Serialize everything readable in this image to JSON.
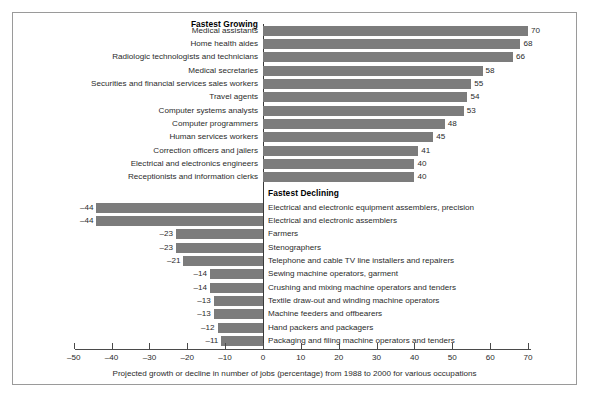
{
  "figure": {
    "caption": "Projected growth or decline in number of jobs (percentage) from 1988 to 2000 for various occupations",
    "bar_color": "#7c7c7c",
    "axis_color": "#4a4a4a",
    "frame_color": "#9a9a9a",
    "background": "#ffffff"
  },
  "sections": {
    "growing_heading": "Fastest Growing",
    "declining_heading": "Fastest Declining"
  },
  "chart_data": {
    "type": "bar",
    "orientation": "horizontal",
    "title": "",
    "subtitle": "",
    "xlabel": "Projected growth or decline in number of jobs (percentage) from 1988 to 2000 for various occupations",
    "ylabel": "",
    "xlim": [
      -55,
      76
    ],
    "xticks": [
      -50,
      -40,
      -30,
      -20,
      -10,
      0,
      10,
      20,
      30,
      40,
      50,
      60,
      70
    ],
    "xtick_labels": [
      "-50",
      "-40",
      "-30",
      "-20",
      "-10",
      "0",
      "10",
      "20",
      "30",
      "40",
      "50",
      "60",
      "70"
    ],
    "grid": false,
    "legend": "none",
    "groups": [
      {
        "name": "Fastest Growing",
        "label_side": "left",
        "categories": [
          "Medical assistants",
          "Home health aides",
          "Radiologic technologists and technicians",
          "Medical secretaries",
          "Securities and financial services sales workers",
          "Travel agents",
          "Computer systems analysts",
          "Computer programmers",
          "Human services workers",
          "Correction officers and jailers",
          "Electrical and electronics engineers",
          "Receptionists and information clerks"
        ],
        "values": [
          70,
          68,
          66,
          58,
          55,
          54,
          53,
          48,
          45,
          41,
          40,
          40
        ],
        "data_labels": [
          "70",
          "68",
          "66",
          "58",
          "55",
          "54",
          "53",
          "48",
          "45",
          "41",
          "40",
          "40"
        ]
      },
      {
        "name": "Fastest Declining",
        "label_side": "right",
        "categories": [
          "Electrical and electronic equipment assemblers, precision",
          "Electrical and electronic assemblers",
          "Farmers",
          "Stenographers",
          "Telephone and cable TV line installers and repairers",
          "Sewing machine operators, garment",
          "Crushing and mixing machine operators and tenders",
          "Textile draw-out and winding machine operators",
          "Machine feeders and offbearers",
          "Hand packers and packagers",
          "Packaging and filing machine operators and tenders"
        ],
        "values": [
          -44,
          -44,
          -23,
          -23,
          -21,
          -14,
          -14,
          -13,
          -13,
          -12,
          -11
        ],
        "data_labels": [
          "-44",
          "-44",
          "-23",
          "-23",
          "-21",
          "-14",
          "-14",
          "-13",
          "-13",
          "-12",
          "-11"
        ]
      }
    ]
  }
}
